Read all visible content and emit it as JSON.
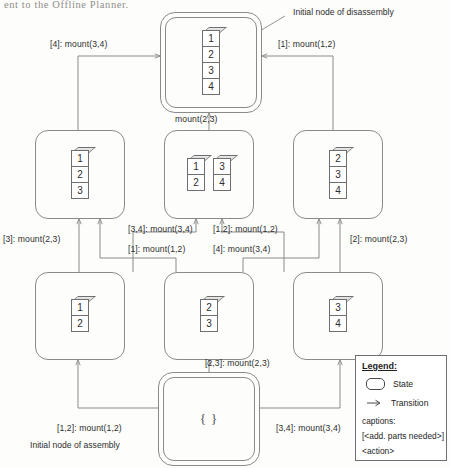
{
  "page": {
    "header_text_fragment": "ent to the Offline Planner."
  },
  "annotations": {
    "top_right": "Initial node of disassembly",
    "bottom_left": "Initial node of assembly"
  },
  "nodes": {
    "top": {
      "id": "state-1234",
      "kind": "double",
      "stacks": [
        [
          "1",
          "2",
          "3",
          "4"
        ]
      ]
    },
    "mid_left": {
      "id": "state-123",
      "kind": "single",
      "stacks": [
        [
          "1",
          "2",
          "3"
        ]
      ]
    },
    "mid_center": {
      "id": "state-12-34",
      "kind": "single",
      "stacks": [
        [
          "1",
          "2"
        ],
        [
          "3",
          "4"
        ]
      ]
    },
    "mid_right": {
      "id": "state-234",
      "kind": "single",
      "stacks": [
        [
          "2",
          "3",
          "4"
        ]
      ]
    },
    "low_left": {
      "id": "state-12",
      "kind": "single",
      "stacks": [
        [
          "1",
          "2"
        ]
      ]
    },
    "low_center": {
      "id": "state-23",
      "kind": "single",
      "stacks": [
        [
          "2",
          "3"
        ]
      ]
    },
    "low_right": {
      "id": "state-34",
      "kind": "single",
      "stacks": [
        [
          "3",
          "4"
        ]
      ]
    },
    "bottom": {
      "id": "state-empty",
      "kind": "double",
      "label": "{ }"
    }
  },
  "edges": [
    {
      "name": "edge-123-to-1234",
      "label": "[4]: mount(3,4)"
    },
    {
      "name": "edge-234-to-1234",
      "label": "[1]: mount(1,2)"
    },
    {
      "name": "edge-1234-mid",
      "label": "mount(2,3)"
    },
    {
      "name": "edge-12-to-123",
      "label": "[3]: mount(2,3)"
    },
    {
      "name": "edge-12-to-1234mid",
      "label": "[3,4]: mount(3,4)"
    },
    {
      "name": "edge-23-to-123",
      "label": "[1]: mount(1,2)"
    },
    {
      "name": "edge-34-to-1234mid",
      "label": "[1,2]: mount(1,2)"
    },
    {
      "name": "edge-34-to-234",
      "label": "[4]: mount(3,4)"
    },
    {
      "name": "edge-23-to-234",
      "label": "[2]: mount(2,3)"
    },
    {
      "name": "edge-empty-to-12",
      "label": "[1,2]: mount(1,2)"
    },
    {
      "name": "edge-empty-to-23",
      "label": "[2,3]: mount(2,3)"
    },
    {
      "name": "edge-empty-to-34",
      "label": "[3,4]: mount(3,4)"
    }
  ],
  "legend": {
    "title": "Legend:",
    "state_label": "State",
    "transition_label": "Transition",
    "captions_title": "captions:",
    "captions_line1": "[<add. parts needed>]",
    "captions_line2": "<action>"
  },
  "colors": {
    "stroke": "#8a8a8a",
    "block_stroke": "#6f6f6f",
    "background": "#fdfdfb",
    "text": "#2e2e2e"
  }
}
